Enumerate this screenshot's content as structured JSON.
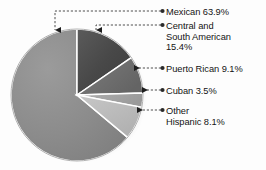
{
  "figure": {
    "background_color": "#fdfdfd",
    "text_color": "#141414",
    "leader_color": "#3b3b3b"
  },
  "chart_data": {
    "type": "pie",
    "title": "",
    "subtitle": "",
    "xlabel": "",
    "ylabel": "",
    "grid": false,
    "legend_position": "right-callouts",
    "start_angle_deg": -90,
    "direction": "clockwise",
    "categories": [
      "Mexican",
      "Central and South American",
      "Puerto Rican",
      "Cuban",
      "Other Hispanic"
    ],
    "values": [
      63.9,
      15.4,
      9.1,
      3.5,
      8.1
    ],
    "value_unit": "%",
    "slice_colors": [
      "#8a8a8a",
      "#4a4a4a",
      "#6e6e6e",
      "#a5a5a5",
      "#b9b9b9"
    ],
    "slice_edge_color": "#ffffff",
    "labels": [
      "Mexican 63.9%",
      "Central and\nSouth American\n15.4%",
      "Puerto Rican 9.1%",
      "Cuban 3.5%",
      "Other\nHispanic 8.1%"
    ]
  },
  "callouts": {
    "mexican": "Mexican 63.9%",
    "central_south_american": "Central and\nSouth American\n15.4%",
    "puerto_rican": "Puerto Rican 9.1%",
    "cuban": "Cuban 3.5%",
    "other_hispanic": "Other\nHispanic 8.1%"
  }
}
